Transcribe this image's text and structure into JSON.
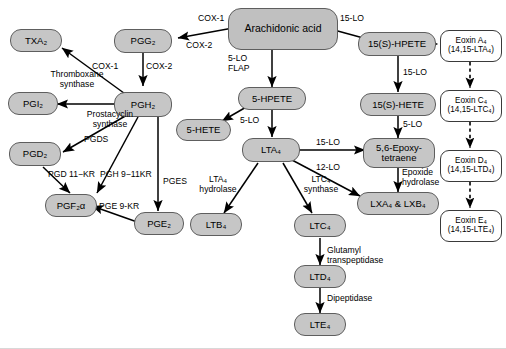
{
  "figure": {
    "node_fill": "#c6c6c6",
    "node_stroke": "#5e5e5e",
    "eoxin_fill": "#ffffff",
    "arrow_color": "#000000",
    "background": "#ffffff"
  },
  "nodes": {
    "arachidonic_acid": "Arachidonic acid",
    "pgg2": "PGG₂",
    "pgh2": "PGH₂",
    "txa2": "TXA₂",
    "pgi2": "PGI₂",
    "pgd2": "PGD₂",
    "pgf2a": "PGF₂α",
    "pge2": "PGE₂",
    "hpete5": "5-HPETE",
    "hete5": "5-HETE",
    "lta4": "LTA₄",
    "ltb4": "LTB₄",
    "ltc4": "LTC₄",
    "ltd4": "LTD₄",
    "lte4": "LTE₄",
    "hpete15s": "15(S)-HPETE",
    "hete15s": "15(S)-HETE",
    "epoxytetraene": "5,6-Epoxy-\ntetraene",
    "lipoxins": "LXA₄ & LXB₄",
    "eoxin_a4": "Eoxin A₄\n(14,15-LTA₄)",
    "eoxin_c4": "Eoxin C₄\n(14,15-LTC₄)",
    "eoxin_d4": "Eoxin D₄\n(14,15-LTD₄)",
    "eoxin_e4": "Eoxin E₄\n(14,15-LTE₄)"
  },
  "enzymes": {
    "cox1_top": "COX-1",
    "cox2_top": "COX-2",
    "cox1_mid": "COX-1",
    "cox2_mid": "COX-2",
    "thromboxane_synthase": "Thromboxane\nsynthase",
    "prostacyclin_synthase": "Prostacyclin\nsynthase",
    "pgds": "PGDS",
    "pges": "PGES",
    "pgd_11kr": "PGD 11−KR",
    "pgh_9_11kr": "PGH 9−11KR",
    "pge_9kr": "PGE 9-KR",
    "lo5_flap": "5-LO\nFLAP",
    "lo5_a": "5-LO",
    "lo5_b": "5-LO",
    "lo5_c": "5-LO",
    "lta4_hydrolase": "LTA₄\nhydrolase",
    "ltc4_synthase": "LTC₄\nsynthase",
    "glutamyl_transpeptidase": "Glutamyl\ntranspeptidase",
    "dipeptidase": "Dipeptidase",
    "lo15_top": "15-LO",
    "lo15_right": "15-LO",
    "lo15_lta4": "15-LO",
    "lo12_lta4": "12-LO",
    "epoxide_hydrolase": "Epoxide\nhydrolase"
  }
}
